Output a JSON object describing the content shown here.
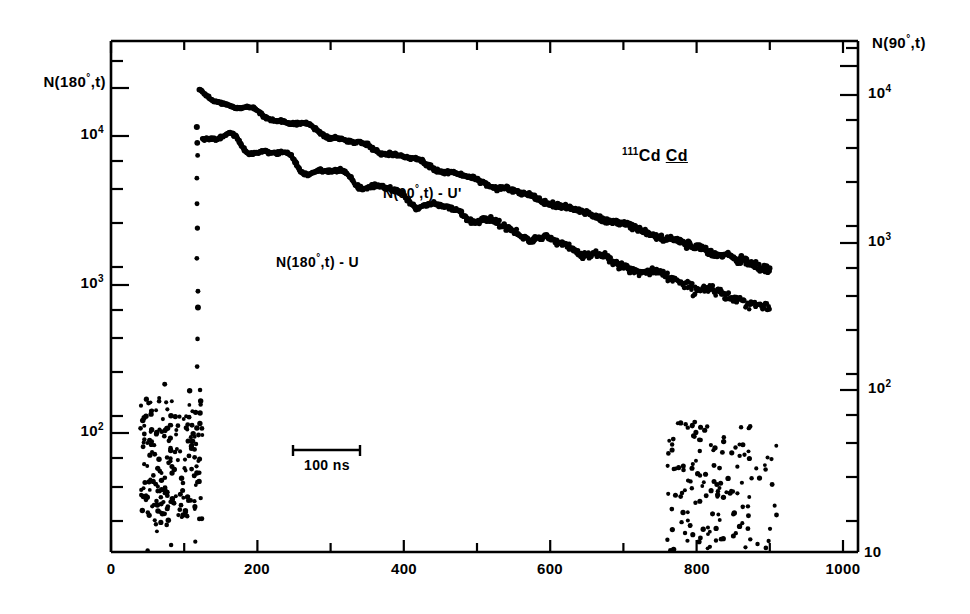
{
  "figure": {
    "sample_label_prefix": "111",
    "sample_label_main": "Cd ",
    "sample_label_underlined": "Cd",
    "scale_bar_label": "100 ns"
  },
  "axes": {
    "left": {
      "title_prefix": "N(180",
      "title_degree": "°",
      "title_suffix": ",t)",
      "tick_labels": [
        "10",
        "10",
        "10"
      ],
      "tick_exponents": [
        "4",
        "3",
        "2"
      ],
      "tick_values": [
        10000,
        1000,
        100
      ]
    },
    "right": {
      "title_prefix": "N(90",
      "title_degree": "°",
      "title_suffix": ",t)",
      "tick_labels": [
        "10",
        "10",
        "10",
        "10"
      ],
      "tick_exponents": [
        "4",
        "3",
        "2",
        ""
      ],
      "tick_values": [
        10000,
        1000,
        100,
        10
      ]
    },
    "bottom": {
      "tick_labels": [
        "0",
        "200",
        "400",
        "600",
        "800",
        "1000"
      ],
      "tick_values": [
        0,
        200,
        400,
        600,
        800,
        1000
      ]
    }
  },
  "series_labels": {
    "upper_prefix": "N(90",
    "upper_degree": "°",
    "upper_suffix": ",t) - U'",
    "lower_prefix": "N(180",
    "lower_degree": "°",
    "lower_suffix": ",t) - U"
  },
  "chart_data": {
    "type": "scatter",
    "title": "",
    "subtitle": "",
    "xlabel": "",
    "ylabel": "N(180°,t)",
    "y2label": "N(90°,t)",
    "xlim": [
      0,
      1050
    ],
    "ylim_left": [
      10,
      35000
    ],
    "ylim_right": [
      10,
      48000
    ],
    "yscale": "log",
    "xscale": "linear",
    "grid": false,
    "legend": "inline-annotations",
    "xtick_values": [
      0,
      100,
      200,
      300,
      400,
      500,
      600,
      700,
      800,
      900,
      1000
    ],
    "xtick_labeled": [
      0,
      200,
      400,
      600,
      800,
      1000
    ],
    "ytick_decades_left": [
      10000,
      1000,
      100
    ],
    "ytick_decades_right": [
      10000,
      1000,
      100,
      10
    ],
    "annotations": [
      {
        "text": "N(90°,t) - U'",
        "x": 390,
        "y": 2600
      },
      {
        "text": "N(180°,t) - U",
        "x": 250,
        "y": 1450
      },
      {
        "text": "111Cd Cd",
        "x": 770,
        "y": 5200
      },
      {
        "text": "100 ns",
        "x": 250,
        "y": 55
      }
    ],
    "scale_bar": {
      "label": "100 ns",
      "x_start": 250,
      "x_end": 340,
      "value": 100,
      "units": "ns"
    },
    "series": [
      {
        "name": "N(90°,t) - U'",
        "marker": "dot",
        "color": "#000000",
        "description": "Upper decay curve, peaks near t=120 ns at ~1.9e4 counts, exponential decay with quadrupole-interaction modulation, merging into background near t=900 ns",
        "peak_x": 120,
        "peak_y": 19000,
        "decay_constant_ns": 285,
        "end_x": 900,
        "end_y": 55
      },
      {
        "name": "N(180°,t) - U",
        "marker": "dot",
        "color": "#000000",
        "description": "Lower decay curve, peaks near t=125 ns at ~1.05e4 counts, exponential decay with stronger modulation amplitude, merging into background near t=900 ns",
        "peak_x": 125,
        "peak_y": 10500,
        "decay_constant_ns": 278,
        "end_x": 900,
        "end_y": 40
      },
      {
        "name": "prompt-rise",
        "marker": "dot",
        "color": "#000000",
        "description": "Vertical prompt leading edge at t~118 ns spanning from background ~1e2 up to the peak",
        "x": 118
      },
      {
        "name": "background",
        "marker": "dot",
        "color": "#000000",
        "description": "Random-coincidence background cloud for t < 120 ns, scattered between ~25 and ~150 counts",
        "x_range": [
          40,
          125
        ],
        "y_range": [
          25,
          170
        ]
      }
    ]
  }
}
